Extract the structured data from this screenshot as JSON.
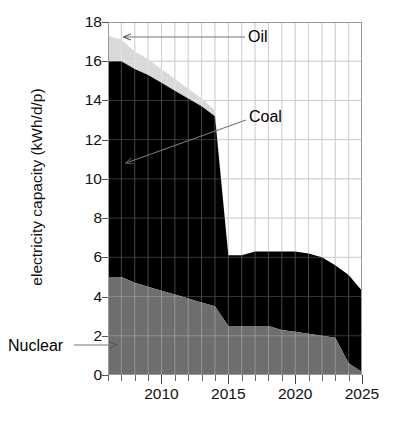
{
  "chart_data": {
    "type": "area",
    "stacked": true,
    "title": "",
    "subtitle": "",
    "xlabel": "",
    "ylabel": "electricity capacity (kWh/d/p)",
    "xlim": [
      2006,
      2025
    ],
    "ylim": [
      0,
      18
    ],
    "grid": true,
    "grid_x_step": 1,
    "grid_y_step": 2,
    "legend_position": "inline-annotations",
    "x_tick_labels": [
      "2010",
      "2015",
      "2020",
      "2025"
    ],
    "x_major_ticks": [
      2010,
      2015,
      2020,
      2025
    ],
    "y_tick_labels": [
      "0",
      "2",
      "4",
      "6",
      "8",
      "10",
      "12",
      "14",
      "16",
      "18"
    ],
    "y_ticks": [
      0,
      2,
      4,
      6,
      8,
      10,
      12,
      14,
      16,
      18
    ],
    "x": [
      2006,
      2007,
      2008,
      2009,
      2010,
      2011,
      2012,
      2013,
      2014,
      2015,
      2016,
      2017,
      2018,
      2019,
      2020,
      2021,
      2022,
      2023,
      2024,
      2025
    ],
    "series": [
      {
        "name": "Nuclear",
        "color": "#6e6e6e",
        "values": [
          5.0,
          5.0,
          4.7,
          4.5,
          4.3,
          4.1,
          3.9,
          3.7,
          3.5,
          2.5,
          2.5,
          2.5,
          2.5,
          2.3,
          2.2,
          2.1,
          2.0,
          1.9,
          0.6,
          0.15
        ]
      },
      {
        "name": "Coal",
        "color": "#000000",
        "values": [
          11.0,
          11.0,
          10.9,
          10.8,
          10.6,
          10.4,
          10.2,
          10.0,
          9.7,
          3.6,
          3.6,
          3.8,
          3.8,
          4.0,
          4.1,
          4.1,
          4.0,
          3.7,
          4.5,
          4.15
        ]
      },
      {
        "name": "Oil",
        "color": "#d9d9d9",
        "values": [
          1.3,
          1.1,
          0.9,
          0.8,
          0.7,
          0.6,
          0.5,
          0.4,
          0.3,
          0.0,
          0.0,
          0.0,
          0.0,
          0.0,
          0.0,
          0.0,
          0.0,
          0.0,
          0.0,
          0.0
        ]
      }
    ],
    "annotations": [
      {
        "name": "oil-label",
        "text": "Oil",
        "points_to_series": "Oil"
      },
      {
        "name": "coal-label",
        "text": "Coal",
        "points_to_series": "Coal"
      },
      {
        "name": "nuclear-label",
        "text": "Nuclear",
        "points_to_series": "Nuclear"
      }
    ]
  }
}
